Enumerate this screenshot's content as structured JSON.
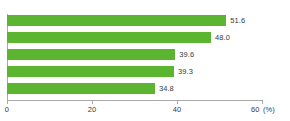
{
  "chart_data": {
    "type": "bar",
    "orientation": "horizontal",
    "title": "",
    "subtitle": "",
    "xlabel": "",
    "ylabel": "",
    "unit_label": "(%)",
    "xlim": [
      0,
      60
    ],
    "xticks": [
      0,
      20,
      40,
      60
    ],
    "xtick_labels": [
      "0",
      "20",
      "40",
      "60"
    ],
    "grid": false,
    "legend": false,
    "categories": [
      "",
      "",
      "",
      "",
      ""
    ],
    "values": [
      51.6,
      48.0,
      39.6,
      39.3,
      34.8
    ],
    "data_labels": [
      "51.6",
      "48.0",
      "39.6",
      "39.3",
      "34.8"
    ],
    "bar_color": "#5cb531",
    "axis_color": "#a8a8a8",
    "text_color": "#3a3a3a",
    "background_color": "#ffffff"
  }
}
